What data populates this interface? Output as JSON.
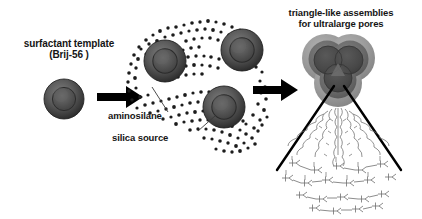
{
  "figure": {
    "kind": "scheme-diagram",
    "background_color": "#ffffff",
    "width": 422,
    "height": 219
  },
  "labels": {
    "surfactant_template_line1": "surfactant template",
    "surfactant_template_line2": "(Brij-56 )",
    "triangle_line1": "triangle-like assemblies",
    "triangle_line2": "for ultralarge pores",
    "aminosilane": "aminosilane",
    "silica_source": "silica source"
  },
  "stages": [
    {
      "id": "stage-1",
      "name": "surfactant-template-micelle",
      "description": "single spherical surfactant micelle"
    },
    {
      "id": "stage-2",
      "name": "micelles-with-silica-and-aminosilane",
      "description": "three micelles dispersed in a field of small dots"
    },
    {
      "id": "stage-3",
      "name": "triangle-like-assembly",
      "description": "trefoil assembly of three micelles in a shell"
    }
  ],
  "arrows": [
    {
      "name": "arrow-stage1-to-stage2"
    },
    {
      "name": "arrow-stage2-to-stage3"
    }
  ],
  "colors": {
    "micelle_outer_ring": "#5d5d5d",
    "micelle_mid_ring": "#3c3c3c",
    "micelle_core": "#555555",
    "assembly_outer_shell": "#9a9a9a",
    "assembly_inner_shell": "#6d6d6d",
    "assembly_core": "#4a4a4a",
    "dot_color": "#1f1f1f",
    "arrow_color": "#000000",
    "text_color": "#151515",
    "magnifier_line_color": "#000000",
    "molecule_color": "#6b6b6b"
  },
  "callouts": [
    {
      "name": "leader-aminosilane"
    },
    {
      "name": "leader-silica-source"
    }
  ],
  "magnifier": {
    "name": "magnification-cone",
    "description": "two black lines expanding from the assembly down to the molecular structure"
  },
  "molecular_inset": {
    "name": "silica-surfactant-molecular-network",
    "description": "schematic wavy surfactant chains terminating in a condensed silica network"
  }
}
